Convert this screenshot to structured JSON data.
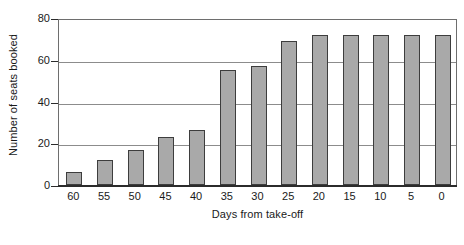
{
  "chart_data": {
    "type": "bar",
    "title": "",
    "xlabel": "Days from take-off",
    "ylabel": "Number of seats booked",
    "categories": [
      "60",
      "55",
      "50",
      "45",
      "40",
      "35",
      "30",
      "25",
      "20",
      "15",
      "10",
      "5",
      "0"
    ],
    "values": [
      6,
      12,
      17,
      23,
      26.5,
      55,
      57,
      69,
      72,
      72,
      72,
      72,
      72
    ],
    "ylim": [
      0,
      80
    ],
    "yticks": [
      0,
      20,
      40,
      60,
      80
    ],
    "ytick_labels": [
      "0",
      "20",
      "40",
      "60",
      "80"
    ],
    "grid": true,
    "grid_axis": "y",
    "legend": false,
    "legend_position": "none",
    "series": [
      {
        "name": "Number of seats booked",
        "values": [
          6,
          12,
          17,
          23,
          26.5,
          55,
          57,
          69,
          72,
          72,
          72,
          72,
          72
        ]
      }
    ],
    "colors": {
      "bar_fill": "#a9a9a9",
      "bar_edge": "#3d3d3d",
      "gridline": "#8c8c8c",
      "axis": "#2b2b2b",
      "plot_border": "#6e6e6e",
      "background": "#ffffff",
      "text": "#1a1a1a"
    }
  }
}
